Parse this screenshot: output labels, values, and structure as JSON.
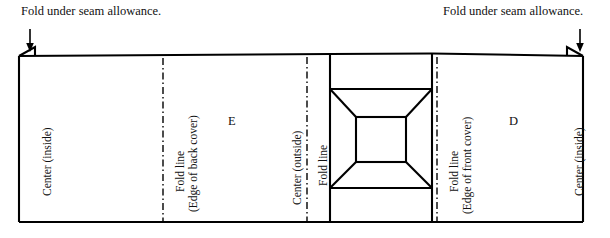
{
  "diagram": {
    "title_top_left": "Fold under seam allowance.",
    "title_top_right": "Fold under seam allowance.",
    "line_color": "#000000",
    "background_color": "#ffffff",
    "panels": [
      {
        "id": "back-cover-panel",
        "letter": "E"
      },
      {
        "id": "front-cover-panel",
        "letter": "D"
      }
    ],
    "vertical_labels": [
      {
        "id": "center-inside-left",
        "text": "Center (inside)"
      },
      {
        "id": "fold-line-back",
        "text": "Fold line"
      },
      {
        "id": "edge-of-back-cover",
        "text": "(Edge of back cover)"
      },
      {
        "id": "center-outside",
        "text": "Center (outside)"
      },
      {
        "id": "fold-line-center",
        "text": "Fold line"
      },
      {
        "id": "fold-line-front",
        "text": "Fold line"
      },
      {
        "id": "edge-of-front-cover",
        "text": "(Edge of front cover)"
      },
      {
        "id": "center-inside-right",
        "text": "Center (inside)"
      }
    ]
  }
}
